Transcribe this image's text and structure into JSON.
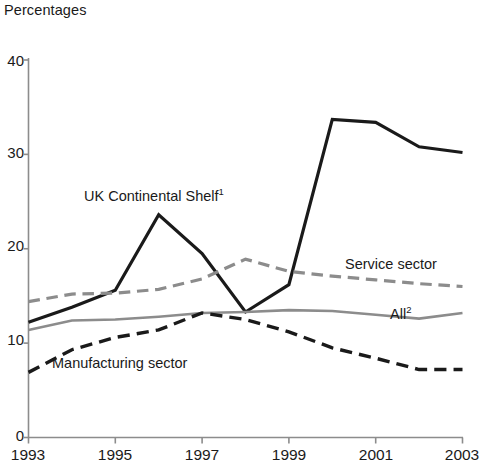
{
  "chart": {
    "title": "Percentages",
    "y_tick_labels": [
      "40",
      "30",
      "20",
      "10",
      "0"
    ],
    "x_tick_labels": [
      "1993",
      "1995",
      "1997",
      "1999",
      "2001",
      "2003"
    ],
    "annotations": {
      "ukcs": "UK Continental Shelf",
      "ukcs_footnote": "1",
      "service": "Service sector",
      "all": "All",
      "all_footnote": "2",
      "manufacturing": "Manufacturing sector"
    },
    "colors": {
      "dark": "#1a1a1a",
      "gray": "#8c8c8c",
      "axis": "#8c8c8c",
      "background": "#ffffff"
    }
  },
  "chart_data": {
    "type": "line",
    "title": "Percentages",
    "xlabel": "",
    "ylabel": "Percentages",
    "xlim": [
      1993,
      2003
    ],
    "ylim": [
      0,
      40
    ],
    "ytick_values": [
      0,
      10,
      20,
      30,
      40
    ],
    "xtick_values": [
      1993,
      1995,
      1997,
      1999,
      2001,
      2003
    ],
    "grid": false,
    "legend": "inline-annotations",
    "x": [
      1993,
      1994,
      1995,
      1996,
      1997,
      1998,
      1999,
      2000,
      2001,
      2002,
      2003
    ],
    "series": [
      {
        "name": "UK Continental Shelf",
        "style": "solid",
        "color": "#1a1a1a",
        "width": 3.2,
        "values": [
          12.2,
          13.8,
          15.6,
          23.6,
          19.5,
          13.3,
          16.2,
          33.7,
          33.4,
          30.8,
          30.2
        ]
      },
      {
        "name": "Service sector",
        "style": "dashed",
        "color": "#8c8c8c",
        "width": 3.2,
        "values": [
          14.4,
          15.2,
          15.3,
          15.7,
          16.8,
          18.9,
          17.6,
          17.1,
          16.7,
          16.3,
          16.0
        ]
      },
      {
        "name": "All",
        "style": "solid",
        "color": "#8c8c8c",
        "width": 2.6,
        "values": [
          11.4,
          12.4,
          12.5,
          12.8,
          13.2,
          13.3,
          13.5,
          13.4,
          13.0,
          12.6,
          13.2
        ]
      },
      {
        "name": "Manufacturing sector",
        "style": "dashed",
        "color": "#1a1a1a",
        "width": 3.4,
        "values": [
          6.9,
          9.3,
          10.6,
          11.4,
          13.2,
          12.5,
          11.2,
          9.5,
          8.4,
          7.2,
          7.2
        ]
      }
    ]
  }
}
